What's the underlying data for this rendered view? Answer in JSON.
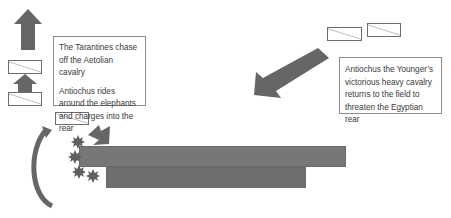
{
  "diagram": {
    "colors": {
      "arrow": "#666666",
      "phalanx_front": "#777777",
      "phalanx_rear": "#6e6e6e",
      "unit_border": "#6e6e6e",
      "elephant": "#5f5f5f",
      "text": "#3a3a3a",
      "box_border": "#8c8c8c"
    },
    "left_textbox": {
      "line1": "The Tarantines chase off the Aetolian cavalry",
      "line2": "Antiochus rides around the elephants and charges into the rear"
    },
    "right_textbox": {
      "text": "Antiochus the Younger’s victorious heavy cavalry returns to the field to threaten the Egyptian rear"
    },
    "units": [
      {
        "name": "aetolian-cavalry-upper",
        "x": 8,
        "y": 60,
        "w": 34,
        "h": 14
      },
      {
        "name": "aetolian-cavalry-lower",
        "x": 8,
        "y": 92,
        "w": 34,
        "h": 14
      },
      {
        "name": "antiochus-cavalry",
        "x": 55,
        "y": 112,
        "w": 34,
        "h": 13
      },
      {
        "name": "younger-cavalry-left",
        "x": 327,
        "y": 27,
        "w": 35,
        "h": 14
      },
      {
        "name": "younger-cavalry-right",
        "x": 367,
        "y": 23,
        "w": 34,
        "h": 14
      }
    ],
    "phalanx": {
      "front": {
        "x": 79,
        "y": 146,
        "w": 267,
        "h": 21
      },
      "rear": {
        "x": 106,
        "y": 167,
        "w": 200,
        "h": 21
      }
    },
    "elephants": [
      {
        "x": 78,
        "y": 142
      },
      {
        "x": 75,
        "y": 157
      },
      {
        "x": 79,
        "y": 172
      },
      {
        "x": 93,
        "y": 176
      }
    ]
  }
}
